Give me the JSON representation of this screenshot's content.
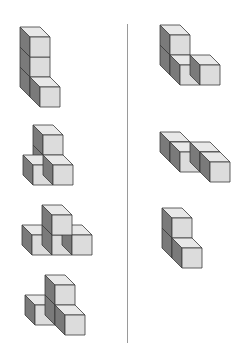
{
  "diagram": {
    "cube_size": 20,
    "depth_offset": 10,
    "colors": {
      "front": "#dcdcdc",
      "top": "#e8e8e8",
      "side": "#7a7a7a",
      "edge": "#3a3a3a",
      "divider": "#9a9a9a"
    },
    "divider": {
      "x": 127,
      "y1": 24,
      "y2": 343
    },
    "left_column": [
      {
        "id": "figure-left-1",
        "origin": [
          40,
          107
        ],
        "cubes": [
          [
            0,
            0,
            1
          ],
          [
            0,
            1,
            1
          ],
          [
            0,
            2,
            1
          ],
          [
            0,
            0,
            0
          ]
        ]
      },
      {
        "id": "figure-left-2",
        "origin": [
          53,
          185
        ],
        "cubes": [
          [
            0,
            0,
            1
          ],
          [
            0,
            1,
            1
          ],
          [
            -1,
            0,
            0
          ],
          [
            0,
            0,
            0
          ]
        ]
      },
      {
        "id": "figure-left-3",
        "origin": [
          52,
          255
        ],
        "cubes": [
          [
            -1,
            0,
            0
          ],
          [
            0,
            0,
            0
          ],
          [
            1,
            0,
            0
          ],
          [
            0,
            1,
            0
          ]
        ]
      },
      {
        "id": "figure-left-4",
        "origin": [
          65,
          335
        ],
        "cubes": [
          [
            0,
            0,
            1
          ],
          [
            0,
            1,
            1
          ],
          [
            -1,
            0,
            1
          ],
          [
            0,
            0,
            0
          ]
        ]
      }
    ],
    "right_column": [
      {
        "id": "figure-right-1",
        "origin": [
          180,
          85
        ],
        "cubes": [
          [
            0,
            0,
            1
          ],
          [
            0,
            1,
            1
          ],
          [
            0,
            0,
            0
          ],
          [
            1,
            0,
            0
          ]
        ]
      },
      {
        "id": "figure-right-2",
        "origin": [
          190,
          182
        ],
        "cubes": [
          [
            0,
            0,
            2
          ],
          [
            0,
            0,
            1
          ],
          [
            1,
            0,
            1
          ],
          [
            1,
            0,
            0
          ]
        ]
      },
      {
        "id": "figure-right-3",
        "origin": [
          182,
          268
        ],
        "cubes": [
          [
            0,
            0,
            1
          ],
          [
            0,
            1,
            1
          ],
          [
            0,
            0,
            0
          ]
        ]
      }
    ]
  }
}
